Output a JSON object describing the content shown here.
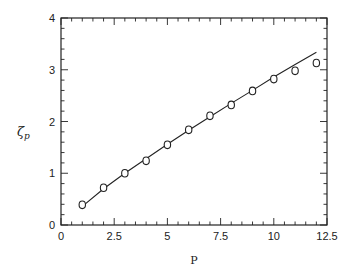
{
  "chart_data": {
    "type": "scatter",
    "title": "",
    "xlabel": "P",
    "ylabel": "ζp",
    "ylabel_main": "ζ",
    "ylabel_sub": "p",
    "xlim": [
      0,
      12.5
    ],
    "ylim": [
      0,
      4
    ],
    "x_ticks": [
      0,
      2.5,
      5,
      7.5,
      10,
      12.5
    ],
    "x_tick_labels": [
      "0",
      "2.5",
      "5",
      "7.5",
      "10",
      "12.5"
    ],
    "y_ticks": [
      0,
      1,
      2,
      3,
      4
    ],
    "y_tick_labels": [
      "0",
      "1",
      "2",
      "3",
      "4"
    ],
    "grid": false,
    "legend": null,
    "series": [
      {
        "name": "measured",
        "style": "open-circle-markers",
        "x": [
          1,
          2,
          3,
          4,
          5,
          6,
          7,
          8,
          9,
          10,
          11,
          12
        ],
        "y": [
          0.39,
          0.72,
          1.0,
          1.24,
          1.55,
          1.84,
          2.11,
          2.32,
          2.59,
          2.82,
          2.98,
          3.13
        ]
      },
      {
        "name": "model",
        "style": "solid-line",
        "x": [
          1,
          2,
          3,
          4,
          5,
          6,
          7,
          8,
          9,
          10,
          11,
          12
        ],
        "y": [
          0.36,
          0.7,
          1.0,
          1.28,
          1.56,
          1.83,
          2.09,
          2.35,
          2.6,
          2.86,
          3.1,
          3.34
        ]
      }
    ]
  }
}
